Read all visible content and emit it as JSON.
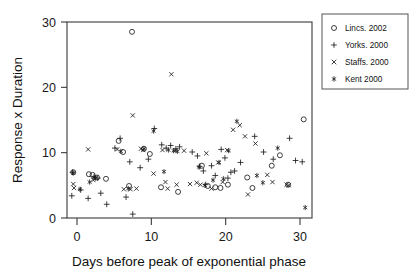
{
  "chart_data": {
    "type": "scatter",
    "title": "",
    "xlabel": "Days before peak of exponential phase",
    "ylabel": "Response x Duration",
    "xlim": [
      -1.5,
      32.5
    ],
    "ylim": [
      0,
      30
    ],
    "xticks": [
      0,
      10,
      20,
      30
    ],
    "yticks": [
      0,
      10,
      20,
      30
    ],
    "xtick_labels": [
      "0",
      "10",
      "20",
      "30"
    ],
    "ytick_labels": [
      "0",
      "10",
      "20",
      "30"
    ],
    "grid": false,
    "legend_position": "outside-top-right",
    "series": [
      {
        "name": "Lincs. 2002",
        "marker": "circle",
        "points": [
          [
            -0.5,
            7.0
          ],
          [
            1.6,
            6.7
          ],
          [
            2.1,
            6.6
          ],
          [
            2.7,
            6.2
          ],
          [
            3.9,
            6.0
          ],
          [
            5.6,
            11.8
          ],
          [
            6.2,
            10.1
          ],
          [
            7.4,
            28.5
          ],
          [
            7.0,
            4.9
          ],
          [
            9.0,
            10.6
          ],
          [
            9.8,
            9.8
          ],
          [
            11.3,
            4.7
          ],
          [
            13.6,
            4.0
          ],
          [
            16.8,
            8.0
          ],
          [
            17.6,
            4.9
          ],
          [
            18.6,
            4.7
          ],
          [
            19.3,
            4.6
          ],
          [
            20.3,
            5.1
          ],
          [
            22.9,
            6.2
          ],
          [
            23.6,
            4.6
          ],
          [
            26.2,
            8.0
          ],
          [
            27.3,
            9.6
          ],
          [
            28.4,
            5.1
          ],
          [
            30.5,
            15.1
          ]
        ]
      },
      {
        "name": "Yorks. 2000",
        "marker": "plus",
        "points": [
          [
            -0.6,
            7.0
          ],
          [
            -0.7,
            3.4
          ],
          [
            0.5,
            4.3
          ],
          [
            1.5,
            3.0
          ],
          [
            2.3,
            6.3
          ],
          [
            2.8,
            6.1
          ],
          [
            3.2,
            3.8
          ],
          [
            4.0,
            2.1
          ],
          [
            5.1,
            10.7
          ],
          [
            5.8,
            12.2
          ],
          [
            6.6,
            3.2
          ],
          [
            7.1,
            8.6
          ],
          [
            7.5,
            0.6
          ],
          [
            8.5,
            7.7
          ],
          [
            9.6,
            9.0
          ],
          [
            10.4,
            13.7
          ],
          [
            11.4,
            11.2
          ],
          [
            12.0,
            10.7
          ],
          [
            12.6,
            11.1
          ],
          [
            13.3,
            10.6
          ],
          [
            13.8,
            10.9
          ],
          [
            15.5,
            10.1
          ],
          [
            16.2,
            9.5
          ],
          [
            16.5,
            7.9
          ],
          [
            17.0,
            7.2
          ],
          [
            17.3,
            5.1
          ],
          [
            18.1,
            8.0
          ],
          [
            18.6,
            6.5
          ],
          [
            19.4,
            10.5
          ],
          [
            19.9,
            9.2
          ],
          [
            20.3,
            6.1
          ],
          [
            20.7,
            7.0
          ],
          [
            21.2,
            7.2
          ],
          [
            22.0,
            8.5
          ],
          [
            23.9,
            12.5
          ],
          [
            25.1,
            10.1
          ],
          [
            26.4,
            9.0
          ],
          [
            28.6,
            12.2
          ],
          [
            29.4,
            8.8
          ],
          [
            30.3,
            8.6
          ]
        ]
      },
      {
        "name": "Staffs. 2000",
        "marker": "cross",
        "points": [
          [
            -0.5,
            5.2
          ],
          [
            -0.4,
            4.6
          ],
          [
            1.5,
            10.5
          ],
          [
            2.2,
            5.8
          ],
          [
            5.4,
            10.5
          ],
          [
            6.3,
            4.4
          ],
          [
            7.2,
            4.4
          ],
          [
            7.5,
            15.7
          ],
          [
            8.0,
            4.5
          ],
          [
            8.6,
            10.6
          ],
          [
            8.9,
            10.4
          ],
          [
            10.3,
            6.8
          ],
          [
            11.5,
            10.4
          ],
          [
            11.9,
            5.5
          ],
          [
            12.7,
            22.0
          ],
          [
            12.2,
            4.5
          ],
          [
            13.2,
            10.3
          ],
          [
            13.4,
            5.1
          ],
          [
            14.4,
            10.3
          ],
          [
            15.2,
            5.2
          ],
          [
            16.1,
            5.4
          ],
          [
            16.6,
            5.1
          ],
          [
            17.4,
            9.9
          ],
          [
            18.1,
            4.5
          ],
          [
            19.0,
            8.5
          ],
          [
            19.6,
            5.5
          ],
          [
            20.2,
            10.4
          ],
          [
            21.0,
            13.5
          ],
          [
            21.9,
            14.2
          ],
          [
            22.6,
            12.5
          ],
          [
            23.0,
            3.6
          ],
          [
            24.0,
            11.4
          ],
          [
            25.6,
            6.6
          ],
          [
            26.3,
            5.5
          ],
          [
            28.2,
            5.1
          ],
          [
            28.5,
            5.0
          ]
        ]
      },
      {
        "name": "Kent 2000",
        "marker": "star",
        "points": [
          [
            -0.5,
            6.9
          ],
          [
            0.4,
            4.4
          ],
          [
            1.7,
            5.5
          ],
          [
            2.3,
            6.2
          ],
          [
            2.5,
            6.1
          ],
          [
            5.9,
            10.2
          ],
          [
            6.9,
            4.5
          ],
          [
            9.0,
            10.6
          ],
          [
            10.3,
            13.3
          ],
          [
            11.7,
            7.1
          ],
          [
            12.3,
            10.4
          ],
          [
            13.0,
            10.3
          ],
          [
            13.5,
            10.2
          ],
          [
            16.4,
            7.8
          ],
          [
            17.2,
            5.0
          ],
          [
            18.3,
            5.8
          ],
          [
            19.1,
            8.5
          ],
          [
            19.7,
            6.0
          ],
          [
            20.4,
            10.3
          ],
          [
            21.5,
            14.8
          ],
          [
            24.2,
            6.5
          ],
          [
            25.0,
            5.4
          ],
          [
            27.0,
            10.7
          ],
          [
            30.7,
            1.6
          ]
        ]
      }
    ]
  },
  "legend": {
    "entries": [
      {
        "label": "Lincs. 2002",
        "marker": "circle"
      },
      {
        "label": "Yorks. 2000",
        "marker": "plus"
      },
      {
        "label": "Staffs. 2000",
        "marker": "cross"
      },
      {
        "label": "Kent 2000",
        "marker": "star"
      }
    ]
  }
}
